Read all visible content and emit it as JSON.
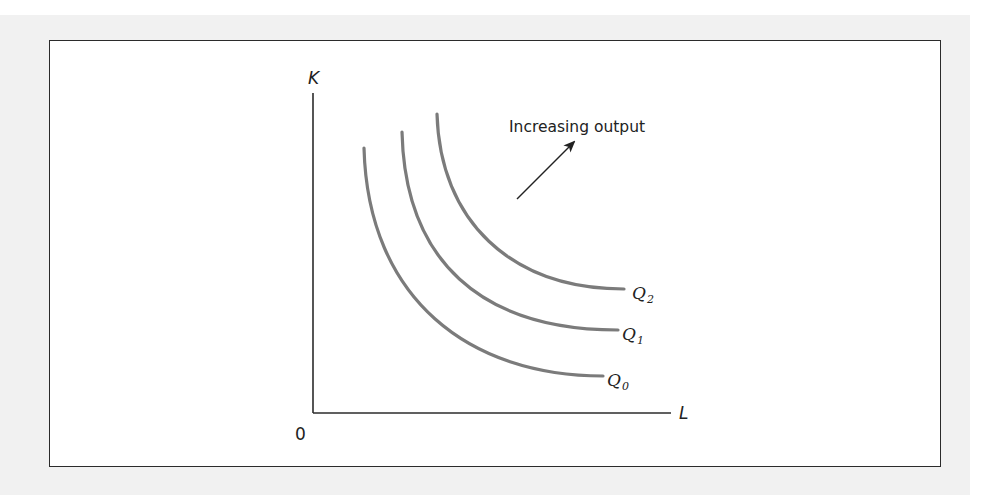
{
  "figure": {
    "axes": {
      "y_label": "K",
      "x_label": "L",
      "origin_label": "0",
      "origin": [
        313,
        413
      ],
      "y_top": 93,
      "x_right": 671
    },
    "curves": [
      {
        "name": "Q",
        "subscript": "0",
        "start": [
          364,
          148
        ],
        "ctrl1": [
          368,
          300
        ],
        "ctrl2": [
          470,
          376
        ],
        "end": [
          603,
          376
        ],
        "label_pos": [
          607,
          386
        ]
      },
      {
        "name": "Q",
        "subscript": "1",
        "start": [
          402,
          132
        ],
        "ctrl1": [
          405,
          260
        ],
        "ctrl2": [
          480,
          330
        ],
        "end": [
          618,
          330
        ],
        "label_pos": [
          622,
          340
        ]
      },
      {
        "name": "Q",
        "subscript": "2",
        "start": [
          437,
          114
        ],
        "ctrl1": [
          440,
          220
        ],
        "ctrl2": [
          510,
          289
        ],
        "end": [
          624,
          289
        ],
        "label_pos": [
          632,
          299
        ]
      }
    ],
    "annotation": {
      "text": "Increasing output",
      "pos": [
        509,
        132
      ],
      "arrow_from": [
        517,
        199
      ],
      "arrow_to": [
        574,
        142
      ]
    },
    "colors": {
      "curve": "#7b7b7b",
      "axis": "#2b2b2b",
      "panel": "#f1f1f1"
    }
  }
}
